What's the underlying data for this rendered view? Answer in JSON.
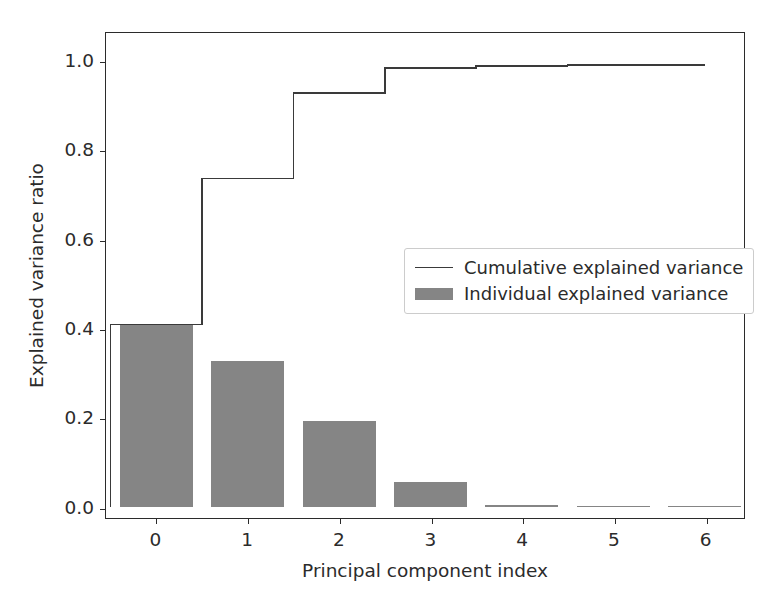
{
  "chart_data": {
    "type": "bar",
    "title": "",
    "xlabel": "Principal component index",
    "ylabel": "Explained variance ratio",
    "categories": [
      "0",
      "1",
      "2",
      "3",
      "4",
      "5",
      "6"
    ],
    "x": [
      0,
      1,
      2,
      3,
      4,
      5,
      6
    ],
    "xlim": [
      -0.55,
      6.43
    ],
    "ylim": [
      -0.025,
      1.065
    ],
    "xticks": [
      0,
      1,
      2,
      3,
      4,
      5,
      6
    ],
    "xticklabels": [
      "0",
      "1",
      "2",
      "3",
      "4",
      "5",
      "6"
    ],
    "yticks": [
      0.0,
      0.2,
      0.4,
      0.6,
      0.8,
      1.0
    ],
    "yticklabels": [
      "0.0",
      "0.2",
      "0.4",
      "0.6",
      "0.8",
      "1.0"
    ],
    "grid": false,
    "legend_position": "center right",
    "bar_width": 0.8,
    "series": [
      {
        "name": "Individual explained variance",
        "type": "bar",
        "color": "#858585",
        "values": [
          0.41,
          0.328,
          0.192,
          0.056,
          0.005,
          0.002,
          0.001
        ]
      },
      {
        "name": "Cumulative explained variance",
        "type": "step",
        "color": "#3a3a3a",
        "values": [
          0.41,
          0.738,
          0.93,
          0.986,
          0.991,
          0.993,
          0.993
        ]
      }
    ]
  },
  "legend": {
    "items": [
      {
        "label": "Cumulative explained variance",
        "handle": "line",
        "color": "#3a3a3a"
      },
      {
        "label": "Individual explained variance",
        "handle": "patch",
        "color": "#858585"
      }
    ]
  },
  "colors": {
    "background": "#ffffff",
    "axis": "#2b2b2b",
    "bar": "#858585",
    "line": "#3a3a3a",
    "legend_border": "#cccccc"
  }
}
